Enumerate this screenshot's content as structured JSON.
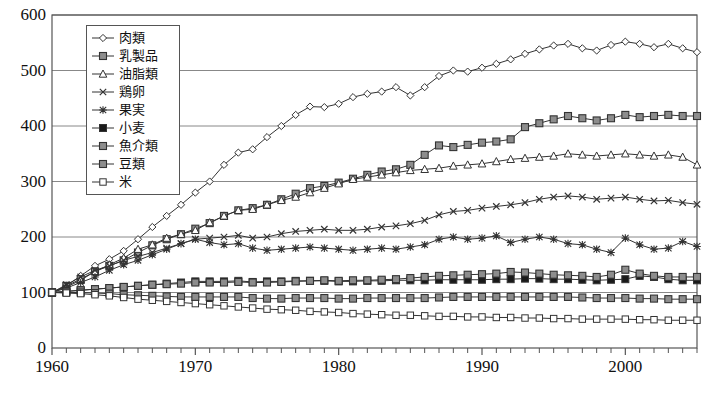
{
  "chart_data": {
    "type": "line",
    "title": "",
    "subtitle": "",
    "xlabel": "",
    "ylabel": "",
    "xlim": [
      1960,
      2005
    ],
    "ylim": [
      0,
      600
    ],
    "ytick_values": [
      0,
      100,
      200,
      300,
      400,
      500,
      600
    ],
    "ytick_labels": [
      "0",
      "100",
      "200",
      "300",
      "400",
      "500",
      "600"
    ],
    "xtick_labels": [
      "1960",
      "1970",
      "1980",
      "1990",
      "2000"
    ],
    "xtick_values": [
      1960,
      1970,
      1980,
      1990,
      2000
    ],
    "x_minor_tick_step": 1,
    "grid": "horizontal",
    "legend_position": "upper-left-inside",
    "x": [
      1960,
      1961,
      1962,
      1963,
      1964,
      1965,
      1966,
      1967,
      1968,
      1969,
      1970,
      1971,
      1972,
      1973,
      1974,
      1975,
      1976,
      1977,
      1978,
      1979,
      1980,
      1981,
      1982,
      1983,
      1984,
      1985,
      1986,
      1987,
      1988,
      1989,
      1990,
      1991,
      1992,
      1993,
      1994,
      1995,
      1996,
      1997,
      1998,
      1999,
      2000,
      2001,
      2002,
      2003,
      2004,
      2005
    ],
    "series": [
      {
        "name": "肉類",
        "marker": "diamond-open",
        "values": [
          100,
          112,
          130,
          148,
          160,
          175,
          196,
          218,
          238,
          258,
          280,
          300,
          330,
          352,
          358,
          380,
          400,
          420,
          435,
          434,
          440,
          452,
          458,
          462,
          470,
          455,
          470,
          490,
          500,
          498,
          505,
          512,
          520,
          530,
          538,
          545,
          548,
          540,
          536,
          546,
          552,
          548,
          542,
          548,
          540,
          533
        ]
      },
      {
        "name": "乳製品",
        "marker": "square-gray",
        "values": [
          100,
          112,
          124,
          138,
          148,
          158,
          172,
          185,
          196,
          205,
          215,
          225,
          238,
          248,
          252,
          258,
          268,
          278,
          288,
          292,
          298,
          305,
          312,
          318,
          322,
          330,
          348,
          365,
          362,
          366,
          370,
          372,
          376,
          398,
          405,
          412,
          418,
          414,
          410,
          414,
          420,
          416,
          418,
          420,
          418,
          418
        ]
      },
      {
        "name": "油脂類",
        "marker": "triangle-open",
        "values": [
          100,
          110,
          122,
          138,
          150,
          162,
          178,
          186,
          198,
          205,
          212,
          226,
          238,
          248,
          250,
          258,
          266,
          272,
          280,
          288,
          296,
          304,
          308,
          312,
          316,
          320,
          322,
          324,
          328,
          330,
          332,
          336,
          340,
          342,
          344,
          346,
          350,
          348,
          346,
          348,
          350,
          348,
          346,
          348,
          344,
          330
        ]
      },
      {
        "name": "鶏卵",
        "marker": "x",
        "values": [
          100,
          114,
          128,
          140,
          148,
          158,
          165,
          172,
          180,
          188,
          196,
          198,
          200,
          203,
          198,
          200,
          206,
          210,
          212,
          214,
          212,
          212,
          214,
          218,
          220,
          224,
          230,
          240,
          246,
          248,
          252,
          255,
          258,
          262,
          268,
          272,
          274,
          272,
          268,
          270,
          272,
          268,
          265,
          266,
          262,
          259
        ]
      },
      {
        "name": "果実",
        "marker": "asterisk",
        "values": [
          100,
          108,
          118,
          128,
          140,
          150,
          158,
          168,
          178,
          188,
          196,
          190,
          186,
          188,
          180,
          176,
          178,
          180,
          182,
          180,
          178,
          176,
          178,
          180,
          178,
          182,
          186,
          196,
          200,
          196,
          198,
          202,
          190,
          196,
          200,
          196,
          188,
          186,
          178,
          172,
          198,
          186,
          178,
          180,
          192,
          183
        ]
      },
      {
        "name": "小麦",
        "marker": "square-filled",
        "values": [
          100,
          102,
          104,
          106,
          108,
          110,
          112,
          114,
          116,
          118,
          120,
          120,
          120,
          121,
          119,
          120,
          120,
          121,
          121,
          121,
          120,
          120,
          121,
          121,
          122,
          122,
          122,
          123,
          123,
          123,
          123,
          124,
          124,
          125,
          125,
          124,
          124,
          123,
          122,
          123,
          124,
          130,
          128,
          124,
          122,
          122
        ]
      },
      {
        "name": "魚介類",
        "marker": "square-gray",
        "values": [
          100,
          102,
          104,
          106,
          108,
          110,
          112,
          114,
          115,
          116,
          118,
          118,
          118,
          119,
          118,
          118,
          119,
          120,
          121,
          122,
          121,
          122,
          122,
          123,
          124,
          126,
          128,
          130,
          131,
          132,
          133,
          134,
          137,
          136,
          134,
          132,
          131,
          130,
          128,
          132,
          141,
          134,
          130,
          128,
          128,
          128
        ]
      },
      {
        "name": "豆類",
        "marker": "square-gray",
        "values": [
          100,
          100,
          100,
          99,
          98,
          96,
          95,
          94,
          93,
          92,
          92,
          92,
          92,
          92,
          90,
          89,
          89,
          90,
          90,
          90,
          89,
          89,
          90,
          90,
          90,
          90,
          90,
          91,
          92,
          92,
          92,
          92,
          92,
          92,
          92,
          92,
          92,
          91,
          90,
          90,
          90,
          89,
          89,
          88,
          88,
          88
        ]
      },
      {
        "name": "米",
        "marker": "square-open",
        "values": [
          100,
          99,
          98,
          96,
          94,
          91,
          88,
          86,
          84,
          82,
          80,
          78,
          76,
          74,
          72,
          70,
          69,
          68,
          66,
          65,
          64,
          62,
          61,
          60,
          59,
          59,
          58,
          57,
          57,
          56,
          56,
          55,
          55,
          54,
          54,
          53,
          53,
          52,
          52,
          52,
          52,
          51,
          51,
          50,
          50,
          50
        ]
      }
    ]
  },
  "legend": {
    "items": [
      {
        "label": "肉類",
        "marker": "diamond-open"
      },
      {
        "label": "乳製品",
        "marker": "square-gray"
      },
      {
        "label": "油脂類",
        "marker": "triangle-open"
      },
      {
        "label": "鶏卵",
        "marker": "x"
      },
      {
        "label": "果実",
        "marker": "asterisk"
      },
      {
        "label": "小麦",
        "marker": "square-filled"
      },
      {
        "label": "魚介類",
        "marker": "square-gray"
      },
      {
        "label": "豆類",
        "marker": "square-gray"
      },
      {
        "label": "米",
        "marker": "square-open"
      }
    ]
  },
  "colors": {
    "line": "#333333",
    "axis": "#555555",
    "grid": "#888888",
    "marker_fill_gray": "#8d8d8d",
    "marker_fill_white": "#ffffff",
    "marker_fill_black": "#1a1a1a",
    "text": "#111111"
  },
  "caption": ""
}
